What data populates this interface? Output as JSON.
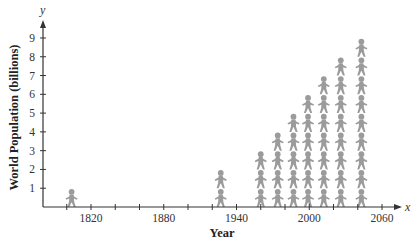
{
  "chart_data": {
    "type": "pictograph",
    "title": "",
    "xlabel": "Year",
    "ylabel": "World Population (billions)",
    "x_axis_symbol": "x",
    "y_axis_symbol": "y",
    "xlim": [
      1780,
      2070
    ],
    "ylim": [
      0,
      9.5
    ],
    "x_ticks": [
      1800,
      1820,
      1840,
      1860,
      1880,
      1900,
      1920,
      1940,
      1960,
      1980,
      2000,
      2020,
      2040,
      2060
    ],
    "x_tick_labels": [
      {
        "value": 1820,
        "label": "1820"
      },
      {
        "value": 1880,
        "label": "1880"
      },
      {
        "value": 1940,
        "label": "1940"
      },
      {
        "value": 2000,
        "label": "2000"
      },
      {
        "value": 2060,
        "label": "2060"
      }
    ],
    "y_ticks": [
      1,
      2,
      3,
      4,
      5,
      6,
      7,
      8,
      9
    ],
    "y_tick_labels": [
      "1",
      "2",
      "3",
      "4",
      "5",
      "6",
      "7",
      "8",
      "9"
    ],
    "grid": false,
    "icon": "person-icon",
    "icon_unit": "1 billion people",
    "icon_color": "#9b9b9b",
    "x": [
      1804,
      1927,
      1960,
      1974,
      1987,
      1999,
      2012,
      2026,
      2043
    ],
    "values": [
      1,
      2,
      3,
      4,
      5,
      6,
      7,
      8,
      9
    ]
  },
  "axes": {
    "x_symbol": "x",
    "y_symbol": "y",
    "x_title": "Year",
    "y_title": "World Population (billions)"
  }
}
